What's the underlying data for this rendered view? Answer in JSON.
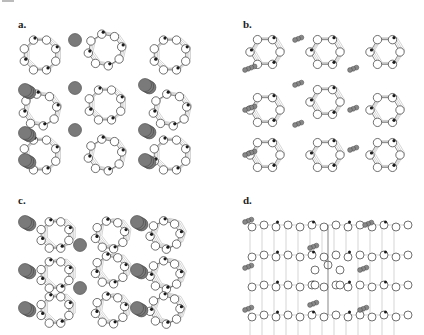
{
  "figure": {
    "panels": [
      {
        "id": "a",
        "label": "a.",
        "view": "framework with large cations",
        "cation_style": "large",
        "x": 18,
        "y": 22
      },
      {
        "id": "b",
        "label": "b.",
        "view": "framework with small cations",
        "cation_style": "small",
        "x": 243,
        "y": 22
      },
      {
        "id": "c",
        "label": "c.",
        "view": "framework with large cations (tilted)",
        "cation_style": "large",
        "x": 18,
        "y": 197
      },
      {
        "id": "d",
        "label": "d.",
        "view": "layered framework side view",
        "cation_style": "small",
        "x": 243,
        "y": 197
      }
    ],
    "legend_colors": {
      "oxygen": "#ffffff",
      "tetrahedral_atom": "#1a1a1a",
      "cation": "#7a7a7a"
    }
  }
}
